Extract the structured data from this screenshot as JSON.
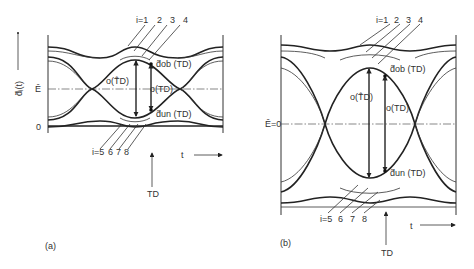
{
  "panel_a": {
    "caption": "(a)",
    "y_axis_label": "d̃ᵢ(t)",
    "e_level_label": "Ê",
    "zero_label": "0",
    "top_trace_labels": [
      "i=1",
      "2",
      "3",
      "4"
    ],
    "bottom_trace_labels": [
      "i=5",
      "6",
      "7",
      "8"
    ],
    "upper_marker_label": "d̃ob (TD)",
    "lower_marker_label": "d̃un (TD)",
    "max_opening_label": "o(T̂D)",
    "opening_label": "o(TD)",
    "time_label": "t",
    "sample_time_label": "TD"
  },
  "panel_b": {
    "caption": "(b)",
    "e_level_label": "Ê=0",
    "top_trace_labels": [
      "i=1",
      "2",
      "3",
      "4"
    ],
    "bottom_trace_labels": [
      "i=5",
      "6",
      "7",
      "8"
    ],
    "upper_marker_label": "d̃ob (TD)",
    "lower_marker_label": "d̃un (TD)",
    "max_opening_label": "o(T̂D)",
    "opening_label": "o(TD)",
    "time_label": "t",
    "sample_time_label": "TD"
  }
}
